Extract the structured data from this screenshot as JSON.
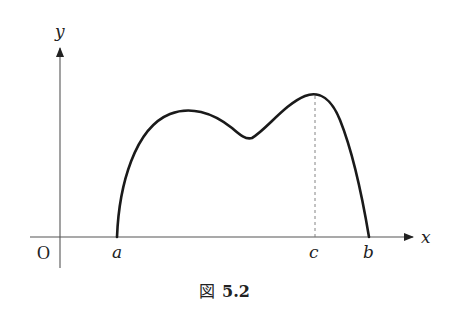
{
  "figure": {
    "caption_prefix": "図",
    "caption_number": "5.2"
  },
  "axes": {
    "x_label": "x",
    "y_label": "y",
    "origin_label": "O"
  },
  "points": {
    "a": "a",
    "b": "b",
    "c": "c"
  },
  "curve": {
    "description": "continuous function on [a,b] with f(a)=f(b)=0, a local max, a local min, and its global max at c",
    "color": "#1a1a1a"
  },
  "guide": {
    "description": "dashed vertical line from x-axis at c up to the maximum"
  }
}
